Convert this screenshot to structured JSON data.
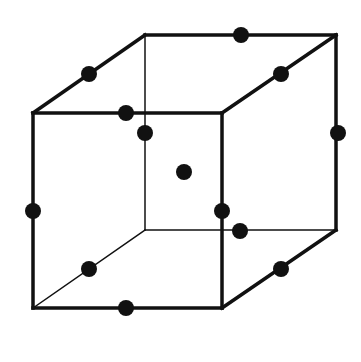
{
  "diagram": {
    "type": "face-centered-cubic-with-edge-centers",
    "colors": {
      "line": "#111111",
      "dot": "#111111",
      "background": "#ffffff"
    },
    "vertices": {
      "front_tl": [
        33,
        113
      ],
      "front_tr": [
        222,
        113
      ],
      "front_bl": [
        33,
        308
      ],
      "front_br": [
        222,
        308
      ],
      "back_tl": [
        145,
        35
      ],
      "back_tr": [
        336,
        35
      ],
      "back_bl": [
        145,
        230
      ],
      "back_br": [
        336,
        230
      ]
    },
    "edges": [
      {
        "name": "front-top",
        "from": "front_tl",
        "to": "front_tr",
        "width": 3.5
      },
      {
        "name": "front-bottom",
        "from": "front_bl",
        "to": "front_br",
        "width": 3.5
      },
      {
        "name": "front-left",
        "from": "front_tl",
        "to": "front_bl",
        "width": 3.5
      },
      {
        "name": "front-right",
        "from": "front_tr",
        "to": "front_br",
        "width": 3.5
      },
      {
        "name": "back-top",
        "from": "back_tl",
        "to": "back_tr",
        "width": 3.5
      },
      {
        "name": "back-right",
        "from": "back_tr",
        "to": "back_br",
        "width": 3.5
      },
      {
        "name": "back-bottom",
        "from": "back_bl",
        "to": "back_br",
        "width": 1.5
      },
      {
        "name": "back-left",
        "from": "back_tl",
        "to": "back_bl",
        "width": 1.5
      },
      {
        "name": "top-left-diag",
        "from": "front_tl",
        "to": "back_tl",
        "width": 3.5
      },
      {
        "name": "top-right-diag",
        "from": "front_tr",
        "to": "back_tr",
        "width": 3.5
      },
      {
        "name": "bottom-right-diag",
        "from": "front_br",
        "to": "back_br",
        "width": 3.5
      },
      {
        "name": "bottom-left-diag",
        "from": "front_bl",
        "to": "back_bl",
        "width": 1.5
      }
    ],
    "dots": [
      {
        "name": "front-top-mid",
        "pos": [
          126,
          113
        ]
      },
      {
        "name": "front-bottom-mid",
        "pos": [
          126,
          308
        ]
      },
      {
        "name": "front-left-mid",
        "pos": [
          33,
          211
        ]
      },
      {
        "name": "front-right-mid",
        "pos": [
          222,
          211
        ]
      },
      {
        "name": "back-top-mid",
        "pos": [
          241,
          35
        ]
      },
      {
        "name": "back-right-mid",
        "pos": [
          338,
          133
        ]
      },
      {
        "name": "back-bottom-mid",
        "pos": [
          240,
          231
        ]
      },
      {
        "name": "back-left-mid",
        "pos": [
          145,
          133
        ]
      },
      {
        "name": "top-left-diag-mid",
        "pos": [
          89,
          74
        ]
      },
      {
        "name": "top-right-diag-mid",
        "pos": [
          281,
          74
        ]
      },
      {
        "name": "bottom-left-diag-mid",
        "pos": [
          89,
          269
        ]
      },
      {
        "name": "bottom-right-diag-mid",
        "pos": [
          281,
          269
        ]
      },
      {
        "name": "body-center",
        "pos": [
          184,
          172
        ]
      }
    ],
    "dot_radius": 8
  }
}
